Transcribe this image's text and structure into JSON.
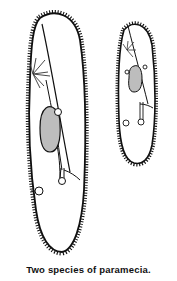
{
  "figure": {
    "caption": "Two species of paramecia.",
    "organisms": [
      {
        "name": "large-paramecium",
        "label": ""
      },
      {
        "name": "small-paramecium",
        "label": ""
      }
    ],
    "colors": {
      "outline": "#111111",
      "nucleus_fill": "#bdbdbd",
      "background": "#ffffff"
    }
  }
}
